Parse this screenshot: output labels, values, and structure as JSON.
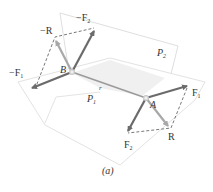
{
  "figure": {
    "caption": "(a)",
    "planes": [
      {
        "id": "P1",
        "label": "P",
        "sub": "1"
      },
      {
        "id": "P2",
        "label": "P",
        "sub": "2"
      }
    ],
    "points": [
      {
        "id": "B",
        "label": "B"
      },
      {
        "id": "A",
        "label": "A"
      }
    ],
    "position_vector": {
      "label": "r"
    },
    "vectors_at_A": [
      {
        "label": "F",
        "sub": "1"
      },
      {
        "label": "F",
        "sub": "2"
      },
      {
        "label": "R",
        "sub": ""
      }
    ],
    "vectors_at_B": [
      {
        "label": "−F",
        "sub": "1"
      },
      {
        "label": "−F",
        "sub": "2"
      },
      {
        "label": "−R",
        "sub": ""
      }
    ],
    "colors": {
      "force_arrow": "#6b6b6b",
      "resultant_arrow": "#a8a8a8",
      "plane_edge": "#d6d6d6",
      "plane_fill": "#f2f2f2",
      "dashed": "#555555",
      "text": "#333333"
    }
  }
}
